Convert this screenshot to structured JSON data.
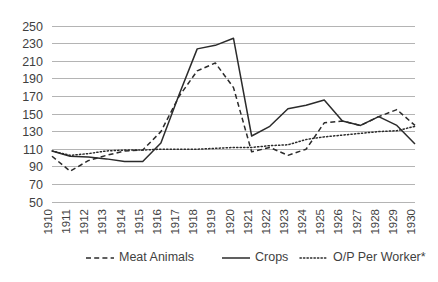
{
  "chart_data": {
    "type": "line",
    "title": "",
    "subtitle": "",
    "xlabel": "",
    "ylabel": "",
    "x": [
      1910,
      1911,
      1912,
      1913,
      1914,
      1915,
      1916,
      1917,
      1918,
      1919,
      1920,
      1921,
      1922,
      1923,
      1924,
      1925,
      1926,
      1927,
      1928,
      1929,
      1930
    ],
    "categories": [
      "1910",
      "1911",
      "1912",
      "1913",
      "1914",
      "1915",
      "1916",
      "1917",
      "1918",
      "1919",
      "1920",
      "1921",
      "1922",
      "1923",
      "1924",
      "1925",
      "1926",
      "1927",
      "1928",
      "1929",
      "1930"
    ],
    "series": [
      {
        "name": "Meat Animals",
        "style": "dashed",
        "color": "#2b2b2b",
        "values": [
          102,
          85,
          97,
          103,
          108,
          109,
          130,
          170,
          199,
          208,
          180,
          107,
          112,
          103,
          110,
          140,
          142,
          137,
          147,
          155,
          137
        ]
      },
      {
        "name": "Crops",
        "style": "solid",
        "color": "#2b2b2b",
        "values": [
          108,
          102,
          101,
          99,
          96,
          96,
          117,
          172,
          224,
          228,
          236,
          125,
          136,
          156,
          160,
          166,
          142,
          137,
          147,
          137,
          116
        ]
      },
      {
        "name": "O/P Per Worker*",
        "style": "dotted",
        "color": "#2b2b2b",
        "values": [
          108,
          103,
          105,
          108,
          109,
          109,
          110,
          110,
          110,
          111,
          112,
          112,
          114,
          115,
          121,
          124,
          126,
          128,
          130,
          131,
          136
        ]
      }
    ],
    "ylim": [
      50,
      250
    ],
    "yticks": [
      250,
      230,
      210,
      190,
      170,
      150,
      130,
      110,
      90,
      70,
      50
    ],
    "grid": true,
    "legend_position": "bottom",
    "legend": [
      "Meat Animals",
      "Crops",
      "O/P Per Worker*"
    ],
    "footnote": ""
  },
  "axes": {
    "y_tick_labels": [
      "250",
      "230",
      "210",
      "190",
      "170",
      "150",
      "130",
      "110",
      "90",
      "70",
      "50"
    ],
    "x_tick_labels": [
      "1910",
      "1911",
      "1912",
      "1913",
      "1914",
      "1915",
      "1916",
      "1917",
      "1918",
      "1919",
      "1920",
      "1921",
      "1922",
      "1923",
      "1924",
      "1925",
      "1926",
      "1927",
      "1928",
      "1929",
      "1930"
    ]
  },
  "legend": {
    "items": [
      {
        "label": "Meat Animals",
        "style": "dashed"
      },
      {
        "label": "Crops",
        "style": "solid"
      },
      {
        "label": "O/P Per Worker*",
        "style": "dotted"
      }
    ]
  },
  "colors": {
    "ink": "#2b2b2b",
    "grid": "#b4b4b4",
    "text": "#3f3f3f",
    "background": "#ffffff"
  }
}
